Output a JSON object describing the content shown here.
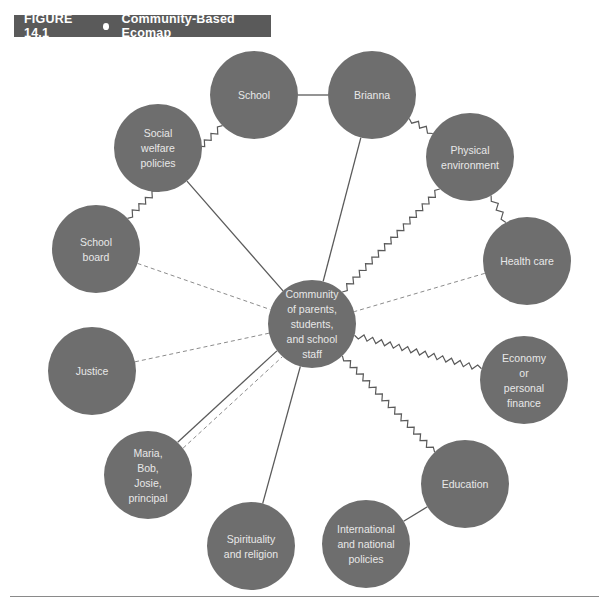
{
  "figure": {
    "number": "FIGURE 14.1",
    "title": "Community-Based Ecomap"
  },
  "colors": {
    "node_fill": "#6e6e6e",
    "line": "#5a5a5a",
    "dashed_line": "#8c8c8c",
    "title_bg": "#5a5a5a"
  },
  "legend_inferred": {
    "solid": "strong connection",
    "dashed": "weak/tenuous connection",
    "zigzag": "stressful connection"
  },
  "nodes": [
    {
      "id": "community",
      "label": [
        "Community",
        "of parents,",
        "students,",
        "and school",
        "staff"
      ],
      "x": 312,
      "y": 324,
      "r": 44
    },
    {
      "id": "school",
      "label": [
        "School"
      ],
      "x": 254,
      "y": 95,
      "r": 44
    },
    {
      "id": "brianna",
      "label": [
        "Brianna"
      ],
      "x": 372,
      "y": 95,
      "r": 44
    },
    {
      "id": "social_welfare",
      "label": [
        "Social",
        "welfare",
        "policies"
      ],
      "x": 158,
      "y": 148,
      "r": 44
    },
    {
      "id": "physical_env",
      "label": [
        "Physical",
        "environment"
      ],
      "x": 470,
      "y": 157,
      "r": 44
    },
    {
      "id": "school_board",
      "label": [
        "School",
        "board"
      ],
      "x": 96,
      "y": 249,
      "r": 44
    },
    {
      "id": "health_care",
      "label": [
        "Health care"
      ],
      "x": 527,
      "y": 261,
      "r": 44
    },
    {
      "id": "justice",
      "label": [
        "Justice"
      ],
      "x": 92,
      "y": 371,
      "r": 44
    },
    {
      "id": "economy",
      "label": [
        "Economy",
        "or",
        "personal",
        "finance"
      ],
      "x": 524,
      "y": 380,
      "r": 44
    },
    {
      "id": "maria",
      "label": [
        "Maria,",
        "Bob,",
        "Josie,",
        "principal"
      ],
      "x": 148,
      "y": 475,
      "r": 44
    },
    {
      "id": "education",
      "label": [
        "Education"
      ],
      "x": 465,
      "y": 484,
      "r": 44
    },
    {
      "id": "spirituality",
      "label": [
        "Spirituality",
        "and religion"
      ],
      "x": 251,
      "y": 546,
      "r": 44
    },
    {
      "id": "international",
      "label": [
        "International",
        "and national",
        "policies"
      ],
      "x": 366,
      "y": 544,
      "r": 44
    }
  ],
  "edges": [
    {
      "from": "school",
      "to": "brianna",
      "type": "solid"
    },
    {
      "from": "brianna",
      "to": "community",
      "type": "solid"
    },
    {
      "from": "brianna",
      "to": "physical_env",
      "type": "zigzag"
    },
    {
      "from": "school",
      "to": "school_board",
      "type": "zigzag"
    },
    {
      "from": "social_welfare",
      "to": "community",
      "type": "solid"
    },
    {
      "from": "physical_env",
      "to": "community",
      "type": "zigzag"
    },
    {
      "from": "physical_env",
      "to": "health_care",
      "type": "zigzag"
    },
    {
      "from": "school_board",
      "to": "community",
      "type": "dashed"
    },
    {
      "from": "health_care",
      "to": "community",
      "type": "dashed"
    },
    {
      "from": "justice",
      "to": "community",
      "type": "dashed"
    },
    {
      "from": "economy",
      "to": "community",
      "type": "zigzag"
    },
    {
      "from": "education",
      "to": "community",
      "type": "zigzag"
    },
    {
      "from": "maria",
      "to": "community",
      "type": "solid",
      "offset": -4
    },
    {
      "from": "maria",
      "to": "community",
      "type": "dashed",
      "offset": 4
    },
    {
      "from": "spirituality",
      "to": "community",
      "type": "solid"
    },
    {
      "from": "education",
      "to": "international",
      "type": "solid"
    }
  ]
}
